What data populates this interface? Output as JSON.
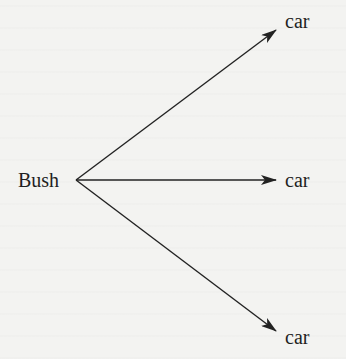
{
  "diagram": {
    "source": {
      "label": "Bush",
      "x": 18,
      "y": 170,
      "anchor": {
        "x": 76,
        "y": 180
      }
    },
    "targets": [
      {
        "label": "car",
        "x": 285,
        "y": 11,
        "arrow_tip": {
          "x": 276,
          "y": 30
        }
      },
      {
        "label": "car",
        "x": 285,
        "y": 170,
        "arrow_tip": {
          "x": 276,
          "y": 180
        }
      },
      {
        "label": "car",
        "x": 285,
        "y": 327,
        "arrow_tip": {
          "x": 276,
          "y": 331
        }
      }
    ],
    "colors": {
      "ink": "#222222",
      "background": "#f3f3f1"
    }
  }
}
